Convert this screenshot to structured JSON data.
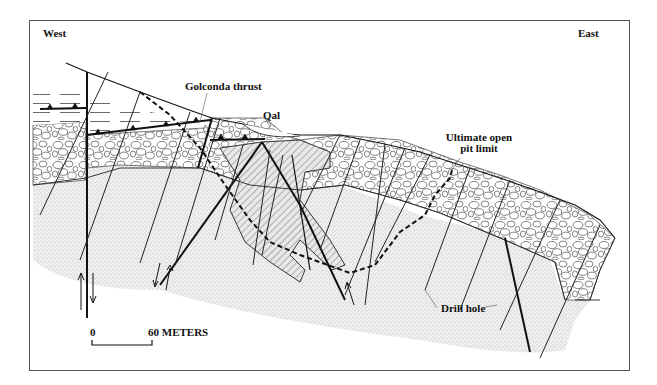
{
  "figure": {
    "type": "geologic-cross-section",
    "orientation": {
      "left": "West",
      "right": "East"
    },
    "labels": {
      "golconda_thrust": "Golconda thrust",
      "qal": "Qal",
      "ultimate_pit_line1": "Ultimate open",
      "ultimate_pit_line2": "pit limit",
      "drill_hole": "Drill hole"
    },
    "scale_bar": {
      "start": "0",
      "end": "60 METERS"
    },
    "units": [
      {
        "name": "upper-plate-shale",
        "pattern": "dashed-horizontal-lines"
      },
      {
        "name": "conglomerate",
        "pattern": "cobbles"
      },
      {
        "name": "sandstone",
        "pattern": "stipple"
      },
      {
        "name": "ore-zone",
        "pattern": "diagonal-hatch"
      },
      {
        "name": "quaternary-alluvium",
        "pattern": "blank"
      }
    ],
    "colors": {
      "line": "#111111",
      "frame": "#555555",
      "stipple": "#bbbbbb",
      "background": "#ffffff"
    }
  }
}
